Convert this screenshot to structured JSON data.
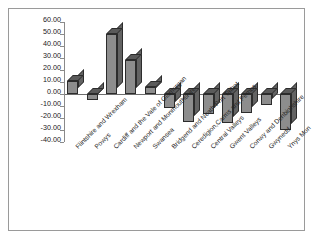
{
  "chart_data": {
    "type": "bar",
    "title": "",
    "subtitle": "",
    "xlabel": "",
    "ylabel": "",
    "ylim": [
      -40,
      60
    ],
    "ytick_step": 10,
    "grid": false,
    "legend": false,
    "style": "3d-column",
    "number_format": "0.00",
    "categories": [
      "Flintshire and Wrexham",
      "Powys",
      "Cardiff and the Vale of Glamorgan",
      "Newport and Monmouthshire",
      "Swansea",
      "Bridgend and Neath Port Talbot",
      "Ceredigion,Carms and Pembs",
      "Central Valleys",
      "Gwent Valleys",
      "Conwy and Denbighshire",
      "Gwynedd",
      "Ynys Mon"
    ],
    "values": [
      11.0,
      -5.0,
      50.0,
      28.0,
      6.0,
      -12.0,
      -23.0,
      -17.0,
      -24.0,
      -16.0,
      -9.0,
      -30.0
    ],
    "ytick_labels": [
      "60.00",
      "50.00",
      "40.00",
      "30.00",
      "20.00",
      "10.00",
      "0.00",
      "-10.00",
      "-20.00",
      "-30.00",
      "-40.00"
    ],
    "ytick_values": [
      60,
      50,
      40,
      30,
      20,
      10,
      0,
      -10,
      -20,
      -30,
      -40
    ],
    "colors": {
      "bar_front": "#8d8d8d",
      "bar_top": "#5a5a5a",
      "bar_side": "#636363",
      "bar_outline": "#2c2c2c",
      "axis": "#8a8a8a",
      "frame": "#9a9a9a",
      "background": "#ffffff",
      "text": "#1a1a1a"
    }
  }
}
